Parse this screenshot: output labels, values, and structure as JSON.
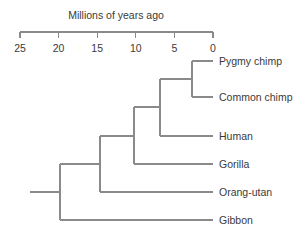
{
  "figure": {
    "kind": "phylogenetic-tree",
    "background_color": "#ffffff",
    "line_color": "#8a8a8a",
    "text_color": "#3a3a3a"
  },
  "axis": {
    "title": "Millions of years ago",
    "ticks": [
      {
        "label": "25",
        "value": 25,
        "x": 20
      },
      {
        "label": "20",
        "value": 20,
        "x": 58.6
      },
      {
        "label": "15",
        "value": 15,
        "x": 97.2
      },
      {
        "label": "10",
        "value": 10,
        "x": 135.8
      },
      {
        "label": "5",
        "value": 5,
        "x": 174.4
      },
      {
        "label": "0",
        "value": 0,
        "x": 213
      }
    ],
    "axis_y": 32,
    "tick_len": 6,
    "range": [
      25,
      0
    ],
    "direction": "right-to-left-decreasing"
  },
  "taxa": [
    {
      "name": "Pygmy chimp",
      "tip_x": 213,
      "tip_y": 61,
      "label_x": 219
    },
    {
      "name": "Common chimp",
      "tip_x": 213,
      "tip_y": 97,
      "label_x": 219
    },
    {
      "name": "Human",
      "tip_x": 213,
      "tip_y": 136,
      "label_x": 219
    },
    {
      "name": "Gorilla",
      "tip_x": 213,
      "tip_y": 164,
      "label_x": 219
    },
    {
      "name": "Orang-utan",
      "tip_x": 213,
      "tip_y": 192,
      "label_x": 219
    },
    {
      "name": "Gibbon",
      "tip_x": 213,
      "tip_y": 220,
      "label_x": 219
    }
  ],
  "nodes": [
    {
      "id": "chimp-split",
      "x": 192,
      "y_top": 61,
      "y_bottom": 97,
      "age_myr": 2.7
    },
    {
      "id": "pan-homo",
      "x": 160,
      "y_top": 79,
      "y_bottom": 136,
      "age_myr": 6.9
    },
    {
      "id": "gorilla-node",
      "x": 134,
      "y_top": 107,
      "y_bottom": 164,
      "age_myr": 10.2
    },
    {
      "id": "orangutan-node",
      "x": 100,
      "y_top": 136,
      "y_bottom": 192,
      "age_myr": 14.6
    },
    {
      "id": "root",
      "x": 60,
      "y_top": 164,
      "y_bottom": 220,
      "age_myr": 19.8
    }
  ],
  "root_stem": {
    "x_start": 30,
    "x_end": 60,
    "y": 192
  }
}
